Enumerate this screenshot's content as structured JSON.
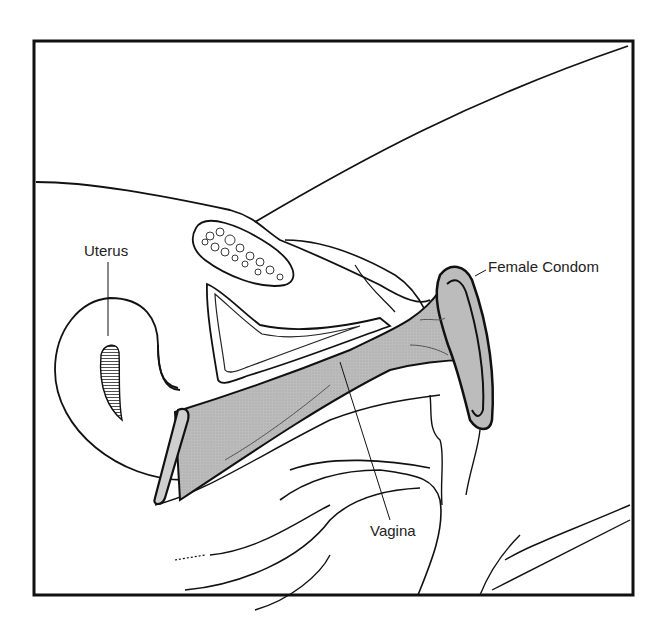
{
  "diagram": {
    "labels": {
      "uterus": "Uterus",
      "female_condom": "Female Condom",
      "vagina": "Vagina"
    },
    "colors": {
      "line": "#111111",
      "condom_fill": "#b8b8b8",
      "background": "#ffffff"
    }
  }
}
